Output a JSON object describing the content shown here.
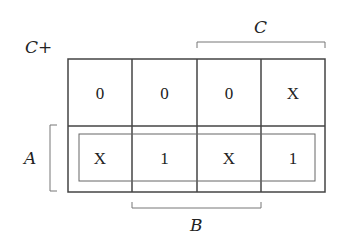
{
  "title": "C+",
  "labels": {
    "A": "A",
    "B": "B",
    "C": "C"
  },
  "grid": {
    "rows": [
      [
        "0",
        "0",
        "0",
        "X"
      ],
      [
        "X",
        "1",
        "X",
        "1"
      ]
    ]
  },
  "groups": [
    {
      "row": 1,
      "col_start": 0,
      "col_end": 3,
      "description": "Bottom row group (A)"
    }
  ],
  "colors": {
    "grid_line": "#444444",
    "bracket_line": "#777777",
    "text": "#222222"
  }
}
